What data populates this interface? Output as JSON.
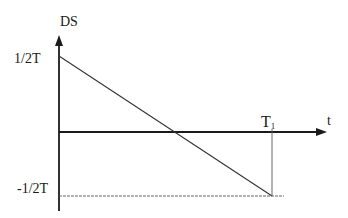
{
  "diagram": {
    "type": "line-plot",
    "y_axis": {
      "label": "DS",
      "tick_labels": {
        "top": "1/2T",
        "bottom": "-1/2T"
      }
    },
    "x_axis": {
      "label": "t",
      "marker": {
        "main": "T",
        "subscript": "1"
      }
    },
    "line": {
      "from": {
        "t": 0,
        "value": "1/2T"
      },
      "to": {
        "t": "T1",
        "value": "-1/2T"
      },
      "zero_crossing": "T1/2"
    },
    "colors": {
      "stroke": "#1a1a1a",
      "guide": "#555555",
      "background": "#ffffff"
    }
  }
}
